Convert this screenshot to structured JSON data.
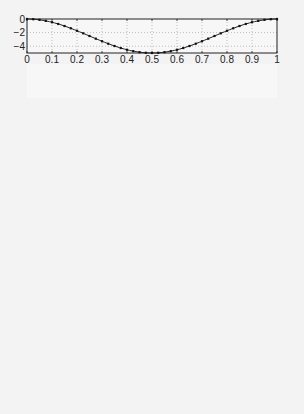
{
  "chart_data": [
    {
      "type": "line",
      "title": "",
      "xlabel": "",
      "ylabel": "",
      "ylim": [
        -5,
        0
      ],
      "yticks": [
        0,
        -2,
        -4
      ],
      "xticks": [
        0,
        0.1,
        0.2,
        0.3,
        0.4,
        0.5,
        0.6,
        0.7,
        0.8,
        0.9,
        1
      ],
      "grid": true,
      "formula": {
        "kind": "cos_half",
        "amp": -2.5
      },
      "x": [
        0,
        0.05,
        0.1,
        0.15,
        0.2,
        0.25,
        0.3,
        0.35,
        0.4,
        0.45,
        0.5,
        0.55,
        0.6,
        0.65,
        0.7,
        0.75,
        0.8,
        0.85,
        0.9,
        0.95,
        1
      ],
      "values": [
        0,
        -0.06,
        -0.24,
        -0.54,
        -0.95,
        -1.46,
        -2.06,
        -2.73,
        -3.45,
        -4.22,
        -5,
        -4.22,
        -3.45,
        -2.73,
        -2.06,
        -1.46,
        -0.95,
        -0.54,
        -0.24,
        -0.06,
        0
      ]
    },
    {
      "type": "line",
      "ylim": [
        -5,
        5
      ],
      "yticks": [
        5,
        0,
        -5
      ],
      "grid": true,
      "formula": {
        "kind": "sin",
        "amp": -4.6,
        "freq": 1.7,
        "phase": 0
      },
      "x": [
        0,
        0.1,
        0.2,
        0.3,
        0.4,
        0.5,
        0.6,
        0.7,
        0.8,
        0.9,
        1
      ],
      "values": [
        0,
        -2.2,
        -4.0,
        -4.6,
        -3.5,
        -0.8,
        2.2,
        4.4,
        4.2,
        1.9,
        0
      ]
    },
    {
      "type": "line",
      "ylim": [
        -5,
        5
      ],
      "yticks": [
        5,
        0,
        -5
      ],
      "grid": true,
      "formula": {
        "kind": "sin",
        "amp": -4.8,
        "freq": 2.5,
        "phase": 0
      },
      "x": [
        0,
        0.1,
        0.2,
        0.3,
        0.4,
        0.5,
        0.6,
        0.7,
        0.8,
        0.9,
        1
      ],
      "values": [
        0,
        -3.4,
        -4.8,
        -3.4,
        0,
        3.4,
        4.8,
        3.4,
        -4.8,
        -3.4,
        0
      ]
    },
    {
      "type": "line",
      "ylim": [
        -5,
        5
      ],
      "yticks": [
        5,
        0,
        -5
      ],
      "grid": true,
      "formula": {
        "kind": "sin",
        "amp": 4.8,
        "freq": 3.3,
        "phase": 0
      },
      "x": [
        0,
        0.1,
        0.2,
        0.3,
        0.4,
        0.5,
        0.6,
        0.7,
        0.8,
        0.9,
        1
      ],
      "values": [
        0,
        4.2,
        4.0,
        -0.6,
        -4.4,
        -3.7,
        1.2,
        4.7,
        3.2,
        -1.8,
        0
      ]
    },
    {
      "type": "line",
      "ylim": [
        0,
        5
      ],
      "yticks": [
        5,
        0
      ],
      "grid": true,
      "formula": {
        "kind": "sin",
        "amp": 4.8,
        "freq": 0.5,
        "phase": 0
      },
      "x": [
        0,
        0.1,
        0.2,
        0.3,
        0.4,
        0.5,
        0.6,
        0.7,
        0.8,
        0.9,
        1
      ],
      "values": [
        0,
        1.5,
        2.8,
        3.9,
        4.6,
        4.8,
        4.6,
        3.9,
        2.8,
        1.5,
        0
      ]
    },
    {
      "type": "line",
      "ylim": [
        -5,
        5
      ],
      "yticks": [
        5,
        0,
        -5
      ],
      "grid": true,
      "formula": {
        "kind": "sin",
        "amp": 4.8,
        "freq": 1,
        "phase": 0
      },
      "x": [
        0,
        0.1,
        0.2,
        0.3,
        0.4,
        0.5,
        0.6,
        0.7,
        0.8,
        0.9,
        1
      ],
      "values": [
        0,
        2.8,
        4.6,
        4.6,
        2.8,
        0,
        -2.8,
        -4.6,
        -4.6,
        -2.8,
        0
      ]
    },
    {
      "type": "line",
      "ylim": [
        -5,
        5
      ],
      "yticks": [
        5,
        0,
        -5
      ],
      "grid": true,
      "formula": {
        "kind": "sin",
        "amp": 4.8,
        "freq": 1.5,
        "phase": 0
      },
      "x": [
        0,
        0.1,
        0.2,
        0.3,
        0.4,
        0.5,
        0.6,
        0.7,
        0.8,
        0.9,
        1
      ],
      "values": [
        0,
        3.9,
        4.6,
        1.5,
        -2.8,
        -4.8,
        -2.8,
        1.5,
        4.6,
        3.9,
        0
      ]
    },
    {
      "type": "line",
      "ylim": [
        -5,
        5
      ],
      "yticks": [
        5,
        0,
        -5
      ],
      "grid": true,
      "formula": {
        "kind": "sin",
        "amp": -4.8,
        "freq": 2,
        "phase": 0
      },
      "x": [
        0,
        0.1,
        0.2,
        0.3,
        0.4,
        0.5,
        0.6,
        0.7,
        0.8,
        0.9,
        1
      ],
      "values": [
        0,
        -4.6,
        -2.8,
        2.8,
        4.6,
        0,
        -4.6,
        -2.8,
        2.8,
        4.6,
        0
      ]
    }
  ],
  "xtick_labels": [
    "0",
    "0.1",
    "0.2",
    "0.3",
    "0.4",
    "0.5",
    "0.6",
    "0.7",
    "0.8",
    "0.9",
    "1"
  ],
  "layout": {
    "left": 27,
    "right": 277,
    "tops": [
      19,
      64,
      112,
      160,
      222,
      270,
      318,
      366
    ],
    "height": 34
  }
}
